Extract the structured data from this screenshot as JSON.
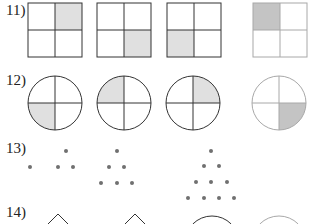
{
  "problems": [
    {
      "number": "11)",
      "type": "squares",
      "shaded_quadrants": [
        "top-right",
        "bottom-right",
        "bottom-left",
        "top-left (answer)"
      ]
    },
    {
      "number": "12)",
      "type": "circles",
      "shaded_quadrants": [
        "bottom-left",
        "top-left",
        "top-right",
        "bottom-right (answer)"
      ]
    },
    {
      "number": "13)",
      "type": "dot-triangles",
      "dot_counts": [
        1,
        3,
        6,
        10
      ]
    },
    {
      "number": "14)",
      "type": "shapes",
      "shapes": [
        "diamond",
        "diamond",
        "circle",
        "circle (answer)"
      ]
    }
  ],
  "colors": {
    "line": "#333333",
    "answer_line": "#a8a8a8",
    "shade": "#e0e0e0",
    "answer_shade": "#c4c4c4",
    "dot": "#707070"
  }
}
